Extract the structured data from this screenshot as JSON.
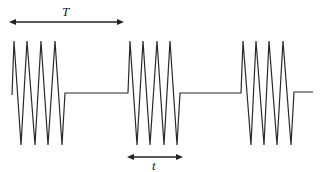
{
  "diagram": {
    "type": "pulsed-waveform",
    "colors": {
      "line": "#2a2a2a",
      "background": "#ffffff"
    },
    "labels": {
      "period": "T",
      "burst_duration": "t"
    },
    "bursts": 3,
    "cycles_per_burst": 4
  }
}
